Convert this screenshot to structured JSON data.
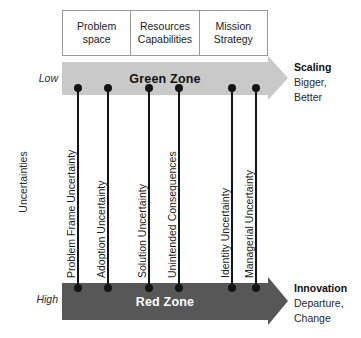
{
  "diagram": {
    "axis_label": "Uncertainties",
    "scale": {
      "low": "Low",
      "high": "High"
    },
    "colors": {
      "green_zone_fill": "#c9c9c9",
      "red_zone_fill": "#575757",
      "green_zone_text": "#111111",
      "red_zone_text": "#ffffff",
      "connector": "#141414",
      "box_border": "#9a9a9a",
      "background": "#ffffff"
    },
    "header_columns": [
      {
        "line1": "Problem",
        "line2": "space"
      },
      {
        "line1": "Resources",
        "line2": "Capabilities"
      },
      {
        "line1": "Mission",
        "line2": "Strategy"
      }
    ],
    "zones": [
      {
        "id": "green",
        "label": "Green Zone",
        "scale_marker": "Low"
      },
      {
        "id": "red",
        "label": "Red Zone",
        "scale_marker": "High"
      }
    ],
    "outcomes": [
      {
        "id": "scaling",
        "title": "Scaling",
        "lines": [
          "Bigger,",
          "Better"
        ]
      },
      {
        "id": "innovation",
        "title": "Innovation",
        "lines": [
          "Departure,",
          "Change"
        ]
      }
    ],
    "uncertainties": [
      {
        "label": "Problem Frame Uncertainty",
        "x": 77,
        "column": "Problem space"
      },
      {
        "label": "Adoption Uncertainty",
        "x": 107,
        "column": "Problem space"
      },
      {
        "label": "Solution Uncertainty",
        "x": 148,
        "column": "Resources Capabilities"
      },
      {
        "label": "Unintended Consequences",
        "x": 178,
        "column": "Resources Capabilities"
      },
      {
        "label": "Identity Uncertainty",
        "x": 231,
        "column": "Mission Strategy"
      },
      {
        "label": "Managerial Uncertainty",
        "x": 255,
        "column": "Mission Strategy"
      }
    ]
  }
}
